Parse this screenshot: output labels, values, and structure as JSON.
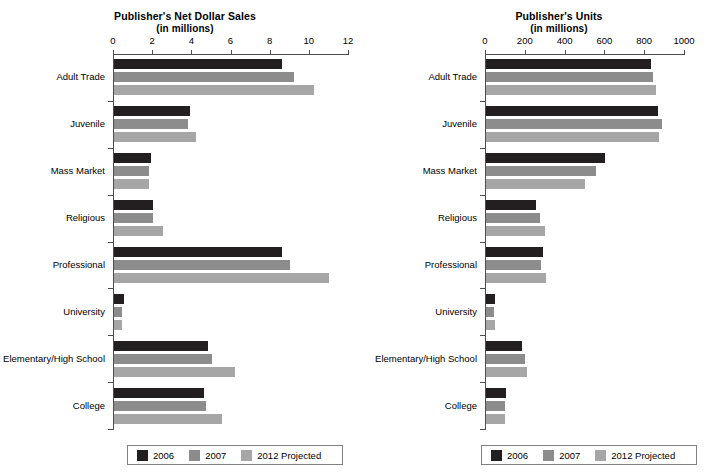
{
  "chart_data": [
    {
      "type": "bar",
      "orientation": "horizontal",
      "title": "Publisher's Net Dollar Sales",
      "subtitle": "(in millions)",
      "xlabel": "",
      "ylabel": "",
      "xlim": [
        0,
        12
      ],
      "xticks": [
        0,
        2,
        4,
        6,
        8,
        10,
        12
      ],
      "xticklabels": [
        "0",
        "2",
        "4",
        "6",
        "8",
        "10",
        "12"
      ],
      "grid": false,
      "legend_position": "bottom",
      "categories": [
        "Adult Trade",
        "Juvenile",
        "Mass Market",
        "Religious",
        "Professional",
        "University",
        "Elementary/High School",
        "College"
      ],
      "series": [
        {
          "name": "2006",
          "color": "#231f20",
          "values": [
            8.6,
            3.9,
            1.9,
            2.0,
            8.6,
            0.5,
            4.8,
            4.6
          ]
        },
        {
          "name": "2007",
          "color": "#8c8c8c",
          "values": [
            9.2,
            3.8,
            1.8,
            2.0,
            9.0,
            0.4,
            5.0,
            4.7
          ]
        },
        {
          "name": "2012 Projected",
          "color": "#a6a6a6",
          "values": [
            10.2,
            4.2,
            1.8,
            2.5,
            11.0,
            0.4,
            6.2,
            5.5
          ]
        }
      ]
    },
    {
      "type": "bar",
      "orientation": "horizontal",
      "title": "Publisher's Units",
      "subtitle": "(in millions)",
      "xlabel": "",
      "ylabel": "",
      "xlim": [
        0,
        1000
      ],
      "xticks": [
        0,
        200,
        400,
        600,
        800,
        1000
      ],
      "xticklabels": [
        "0",
        "200",
        "400",
        "600",
        "800",
        "1000"
      ],
      "grid": false,
      "legend_position": "bottom",
      "categories": [
        "Adult Trade",
        "Juvenile",
        "Mass Market",
        "Religious",
        "Professional",
        "University",
        "Elementary/High School",
        "College"
      ],
      "series": [
        {
          "name": "2006",
          "color": "#231f20",
          "values": [
            829,
            864,
            598,
            251,
            286,
            45,
            181,
            100
          ]
        },
        {
          "name": "2007",
          "color": "#8c8c8c",
          "values": [
            839,
            884,
            553,
            271,
            276,
            40,
            196,
            95
          ]
        },
        {
          "name": "2012 Projected",
          "color": "#a6a6a6",
          "values": [
            854,
            869,
            497,
            296,
            301,
            45,
            206,
            95
          ]
        }
      ]
    }
  ]
}
